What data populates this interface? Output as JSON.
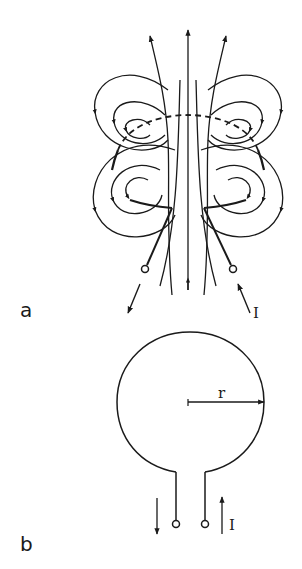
{
  "figure": {
    "panels": [
      {
        "id": "a",
        "label": "a",
        "description": "Current loop with magnetic field lines",
        "current_label": "I"
      },
      {
        "id": "b",
        "label": "b",
        "description": "Circular loop of radius r with leads",
        "radius_label": "r",
        "current_label": "I"
      }
    ]
  },
  "colors": {
    "line": "#1a1a1a",
    "background": "#ffffff"
  }
}
